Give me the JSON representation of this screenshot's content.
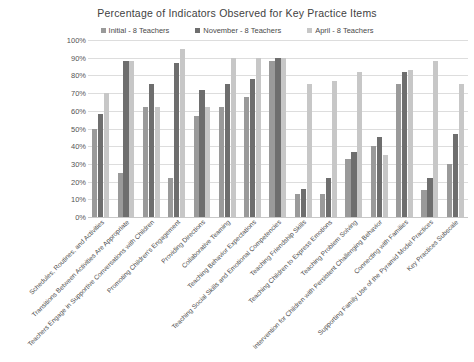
{
  "chart_data": {
    "type": "bar",
    "title": "Percentage of Indicators Observed for Key Practice Items",
    "xlabel": "",
    "ylabel": "",
    "ylim": [
      0,
      100
    ],
    "ytick_labels": [
      "100%",
      "90%",
      "80%",
      "70%",
      "60%",
      "50%",
      "40%",
      "30%",
      "20%",
      "10%",
      "0%"
    ],
    "ytick_values": [
      100,
      90,
      80,
      70,
      60,
      50,
      40,
      30,
      20,
      10,
      0
    ],
    "grid": true,
    "legend_position": "top-center",
    "categories": [
      "Schedules, Routines, and Activities",
      "Transitions Between Activities Are Appropriate",
      "Teachers Engage in Supportive Conversations with Children",
      "Promoting Children's Engagement",
      "Providing Directions",
      "Collaborative Teaming",
      "Teaching Behavior Expectations",
      "Teaching Social Skills and Emotional Competencies",
      "Teaching Friendship Skills",
      "Teaching Children to Express Emotions",
      "Teaching Problem Solving",
      "Intervention for Children with Persistent Challenging Behavior",
      "Connecting with Families",
      "Supporting Family Use of the Pyramid Model Practices",
      "Key Practices Subscale"
    ],
    "series": [
      {
        "name": "Initial - 8 Teachers",
        "color": "#9a9a9a",
        "values": [
          50,
          25,
          62,
          22,
          57,
          62,
          68,
          88,
          13,
          13,
          33,
          40,
          75,
          15,
          30
        ]
      },
      {
        "name": "November - 8 Teachers",
        "color": "#6e6e6e",
        "values": [
          58,
          88,
          75,
          87,
          72,
          75,
          78,
          90,
          16,
          22,
          37,
          45,
          82,
          22,
          47
        ]
      },
      {
        "name": "April - 8 Teachers",
        "color": "#c7c7c7",
        "values": [
          70,
          88,
          62,
          95,
          62,
          90,
          90,
          90,
          75,
          77,
          82,
          35,
          83,
          88,
          75
        ]
      }
    ]
  }
}
